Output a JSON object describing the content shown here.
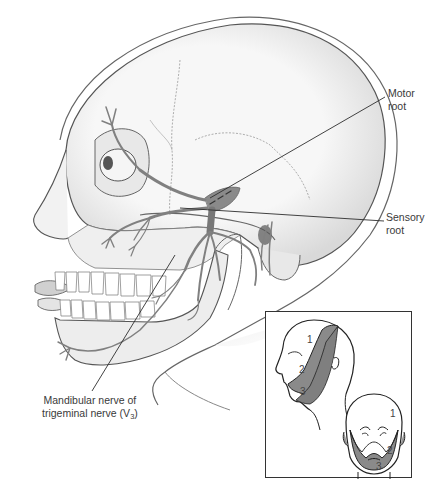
{
  "figure": {
    "colors": {
      "background": "#ffffff",
      "bone": "#f2f2f2",
      "outline": "#555555",
      "nerve": "#8a8a8a",
      "nerve_dark": "#6d6d6d",
      "dermatome_fill": "#8c8c8c",
      "leader_line": "#333333"
    }
  },
  "labels": {
    "motor_root": {
      "line1": "Motor",
      "line2": "root"
    },
    "sensory_root": {
      "line1": "Sensory",
      "line2": "root"
    },
    "mandibular_nerve": {
      "line1": "Mandibular nerve of",
      "line2_prefix": "trigeminal nerve (V",
      "line2_sub": "3",
      "line2_suffix": ")"
    }
  },
  "inset": {
    "title": "Trigeminal dermatomes",
    "lateral_view": {
      "regions": [
        "1",
        "2",
        "3"
      ]
    },
    "frontal_view": {
      "regions": [
        "1",
        "2",
        "3"
      ]
    }
  }
}
